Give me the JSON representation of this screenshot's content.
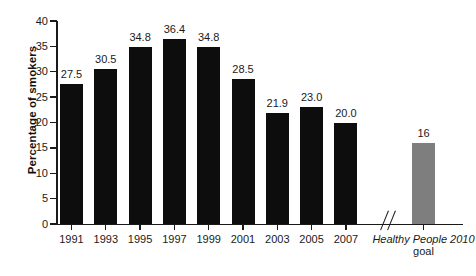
{
  "chart_data": {
    "type": "bar",
    "title": "",
    "subtitle": "",
    "xlabel": "",
    "ylabel": "Percentage of smokers",
    "ylim": [
      0,
      40
    ],
    "ytick_values": [
      0,
      5,
      10,
      15,
      20,
      25,
      30,
      35,
      40
    ],
    "ytick_labels": [
      "0",
      "5",
      "10",
      "15",
      "20",
      "25",
      "30",
      "35",
      "40"
    ],
    "grid": false,
    "legend": "none",
    "categories": [
      "1991",
      "1993",
      "1995",
      "1997",
      "1999",
      "2001",
      "2003",
      "2005",
      "2007",
      "Healthy People 2010 goal"
    ],
    "values": [
      27.5,
      30.5,
      34.8,
      36.4,
      34.8,
      28.5,
      21.9,
      23.0,
      20.0,
      16
    ],
    "value_labels": [
      "27.5",
      "30.5",
      "34.8",
      "36.4",
      "34.8",
      "28.5",
      "21.9",
      "23.0",
      "20.0",
      "16"
    ],
    "bar_colors": [
      "#0d0d0d",
      "#0d0d0d",
      "#0d0d0d",
      "#0d0d0d",
      "#0d0d0d",
      "#0d0d0d",
      "#0d0d0d",
      "#0d0d0d",
      "#0d0d0d",
      "#7e7e7e"
    ],
    "annotations": [
      {
        "name": "axis-break",
        "symbol": "//",
        "between": [
          "2007",
          "Healthy People 2010 goal"
        ]
      }
    ],
    "goal_label": {
      "italic_text": "Healthy People 2010",
      "roman_text": "goal"
    }
  },
  "axis": {
    "y_title": "Percentage of smokers"
  },
  "colors": {
    "background": "#ffffff",
    "axis": "#1a1a1a",
    "bar_primary": "#0d0d0d",
    "bar_goal": "#7e7e7e",
    "text": "#1a1a1a"
  }
}
